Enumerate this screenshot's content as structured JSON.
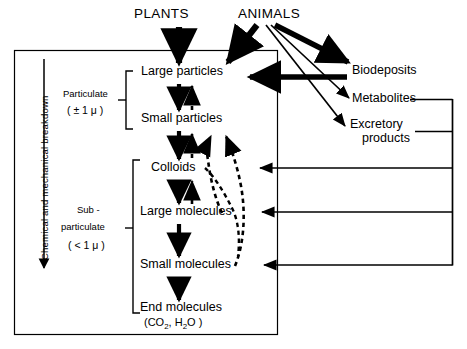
{
  "diagram": {
    "title_sources": {
      "plants": "PLANTS",
      "animals": "ANIMALS"
    },
    "axis_label": "Chemical and mechanical breakdown",
    "size_groups": [
      {
        "name": "Particulate",
        "range": "( ± 1 μ )"
      },
      {
        "name": "Sub -",
        "name2": "particulate",
        "range": "( < 1 μ )"
      }
    ],
    "chain": [
      {
        "id": "large-particles",
        "label": "Large particles"
      },
      {
        "id": "small-particles",
        "label": "Small particles"
      },
      {
        "id": "colloids",
        "label": "Colloids"
      },
      {
        "id": "large-molecules",
        "label": "Large  molecules"
      },
      {
        "id": "small-molecules",
        "label": "Small  molecules"
      },
      {
        "id": "end-molecules",
        "label": "End molecules",
        "formula_prefix": "(CO",
        "formula_sub1": "2",
        "formula_mid": ", H",
        "formula_sub2": "2",
        "formula_suffix": "O )"
      }
    ],
    "outputs": [
      {
        "id": "biodeposits",
        "label": "Biodeposits"
      },
      {
        "id": "metabolites",
        "label": "Metabolites"
      },
      {
        "id": "excretory-products",
        "label": "Excretory",
        "label2": "products"
      }
    ],
    "colors": {
      "ink": "#000000",
      "background": "#ffffff"
    },
    "legend_notes": {
      "solid_arrow": "breakdown",
      "dashed_arrow": "aggregation"
    }
  }
}
